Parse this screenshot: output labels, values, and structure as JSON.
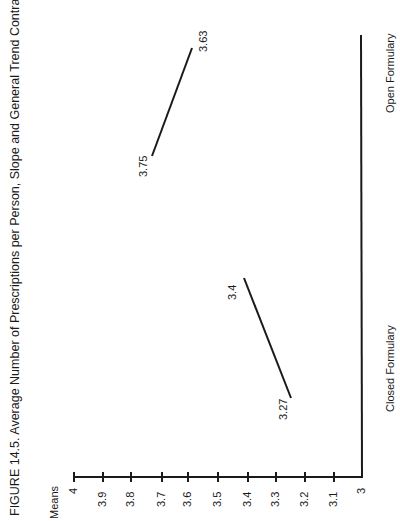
{
  "figure": {
    "title": "FIGURE 14.5. Average Number of Prescriptions per Person, Slope and General Trend Contrasts",
    "axis_label": "Means"
  },
  "chart_data": {
    "type": "line",
    "title": "FIGURE 14.5. Average Number of Prescriptions per Person, Slope and General Trend Contrasts",
    "xlabel": "",
    "ylabel": "Means",
    "ylim": [
      3,
      4
    ],
    "yticks": [
      "4",
      "3.9",
      "3.8",
      "3.7",
      "3.6",
      "3.5",
      "3.4",
      "3.3",
      "3.2",
      "3.1",
      "3"
    ],
    "categories": [
      "Closed Formulary",
      "Open Formulary"
    ],
    "orientation": "rotated 90° counter-clockwise",
    "grid": false,
    "series": [
      {
        "name": "Closed Formulary",
        "values": [
          3.27,
          3.4
        ],
        "labels": [
          "3.27",
          "3.4"
        ]
      },
      {
        "name": "Open Formulary",
        "values": [
          3.75,
          3.63
        ],
        "labels": [
          "3.75",
          "3.63"
        ]
      }
    ]
  },
  "axis": {
    "ticks": [
      {
        "label": "4",
        "x": 74
      },
      {
        "label": "3.9",
        "x": 103
      },
      {
        "label": "3.8",
        "x": 131
      },
      {
        "label": "3.7",
        "x": 162
      },
      {
        "label": "3.6",
        "x": 188
      },
      {
        "label": "3.5",
        "x": 218
      },
      {
        "label": "3.4",
        "x": 248
      },
      {
        "label": "3.3",
        "x": 276
      },
      {
        "label": "3.2",
        "x": 305
      },
      {
        "label": "3.1",
        "x": 334
      },
      {
        "label": "3",
        "x": 362
      }
    ]
  },
  "categories": {
    "closed": "Closed Formulary",
    "open": "Open Formulary"
  },
  "labels": {
    "closed_start": "3.27",
    "closed_end": "3.4",
    "open_start": "3.75",
    "open_end": "3.63"
  },
  "colors": {
    "ink": "#1a1a1a",
    "background": "#ffffff"
  }
}
